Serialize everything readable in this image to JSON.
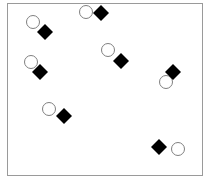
{
  "diagram": {
    "colors": {
      "frame": "#9a9a9a",
      "circle_stroke": "#808080",
      "circle_fill": "#ffffff",
      "diamond_fill": "#000000"
    },
    "pairs": [
      {
        "id": 1,
        "circle": {
          "x": 33,
          "y": 22
        },
        "diamond": {
          "x": 45,
          "y": 32
        }
      },
      {
        "id": 2,
        "circle": {
          "x": 86,
          "y": 12
        },
        "diamond": {
          "x": 101,
          "y": 13
        }
      },
      {
        "id": 3,
        "circle": {
          "x": 108,
          "y": 50
        },
        "diamond": {
          "x": 121,
          "y": 61
        }
      },
      {
        "id": 4,
        "circle": {
          "x": 166,
          "y": 82
        },
        "diamond": {
          "x": 173,
          "y": 72
        }
      },
      {
        "id": 5,
        "circle": {
          "x": 31,
          "y": 62
        },
        "diamond": {
          "x": 40,
          "y": 72
        }
      },
      {
        "id": 6,
        "circle": {
          "x": 49,
          "y": 109
        },
        "diamond": {
          "x": 64,
          "y": 116
        }
      },
      {
        "id": 7,
        "circle": {
          "x": 178,
          "y": 149
        },
        "diamond": {
          "x": 159,
          "y": 147
        }
      }
    ]
  }
}
